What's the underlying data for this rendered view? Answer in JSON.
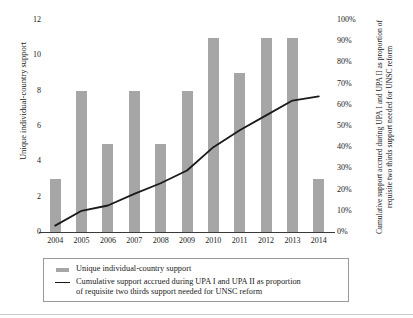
{
  "chart_data": {
    "type": "bar",
    "title": "",
    "categories": [
      "2004",
      "2005",
      "2006",
      "2007",
      "2008",
      "2009",
      "2010",
      "2011",
      "2012",
      "2013",
      "2014"
    ],
    "xlabel": "",
    "grid": false,
    "legend_position": "bottom",
    "series": [
      {
        "name": "Unique individual-country support",
        "type": "bar",
        "axis": "left",
        "color": "#a6a6a6",
        "values": [
          3,
          8,
          5,
          8,
          5,
          8,
          11,
          9,
          11,
          11,
          3
        ]
      },
      {
        "name": "Cumulative support accrued during UPA I and UPA II as proportion of requisite two thirds support needed for UNSC reform",
        "type": "line",
        "axis": "right",
        "color": "#1a1a1a",
        "values": [
          3,
          10,
          12.5,
          18,
          23,
          29,
          40,
          48,
          55,
          62,
          64
        ]
      }
    ],
    "left_axis": {
      "label": "Unique individual-country support",
      "ylim": [
        0,
        12
      ],
      "ticks": [
        "0",
        "2",
        "4",
        "6",
        "8",
        "10",
        "12"
      ],
      "tick_values": [
        0,
        2,
        4,
        6,
        8,
        10,
        12
      ]
    },
    "right_axis": {
      "label": "Cumulative support accrued during UPA I and UPA II as proportion of requisite two thirds support needed for UNSC reform",
      "ylim": [
        0,
        100
      ],
      "ticks": [
        "0%",
        "10%",
        "20%",
        "30%",
        "40%",
        "50%",
        "60%",
        "70%",
        "80%",
        "90%",
        "100%"
      ],
      "tick_values": [
        0,
        10,
        20,
        30,
        40,
        50,
        60,
        70,
        80,
        90,
        100
      ]
    }
  },
  "legend": {
    "items": [
      {
        "key": "bar-swatch",
        "label": "Unique individual-country support"
      },
      {
        "key": "line-swatch",
        "label": "Cumulative support accrued during UPA I and UPA II as proportion\nof requisite two thirds support needed for UNSC reform"
      }
    ]
  }
}
